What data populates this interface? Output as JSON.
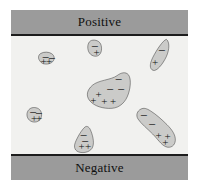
{
  "figure": {
    "name": "dielectric-polarization-diagram",
    "background_color": "#f1f1ef",
    "electrode_color": "#9b9b9b",
    "blob_fill_color": "#cbcbc9",
    "blob_stroke_color": "#1d1d1d"
  },
  "electrodes": {
    "top_label": "Positive",
    "bottom_label": "Negative"
  },
  "symbols": {
    "plus": "+",
    "minus": "−"
  },
  "domains": [
    {
      "name": "domain-upper-left",
      "shape": "rounded-blob",
      "path": "M 86 152 C 80 144 82 134 90 130 C 99 125 113 125 122 131 C 131 137 132 148 125 155 C 117 163 103 164 94 160 C 90 158 88 155 86 152 Z",
      "charges": [
        {
          "sign": "minus",
          "x": 103,
          "y": 141
        },
        {
          "sign": "minus",
          "x": 122,
          "y": 144
        },
        {
          "sign": "plus",
          "x": 98,
          "y": 152
        },
        {
          "sign": "plus",
          "x": 114,
          "y": 153
        }
      ]
    },
    {
      "name": "domain-top-center",
      "shape": "oval-blob",
      "path": "M 238 93 C 230 99 228 113 233 125 C 239 138 254 142 263 136 C 272 130 274 114 269 102 C 264 91 247 87 238 93 Z",
      "charges": [
        {
          "sign": "minus",
          "x": 251,
          "y": 108
        },
        {
          "sign": "plus",
          "x": 257,
          "y": 126
        }
      ]
    },
    {
      "name": "domain-upper-right",
      "shape": "tilted-ellipse-blob",
      "path": "M 466 88 C 456 91 437 119 425 143 C 415 163 416 177 426 181 C 437 185 455 163 466 140 C 476 118 476 95 466 88 Z",
      "charges": [
        {
          "sign": "minus",
          "x": 452,
          "y": 119
        },
        {
          "sign": "plus",
          "x": 432,
          "y": 155
        }
      ]
    },
    {
      "name": "domain-center-large",
      "shape": "teardrop-blob",
      "path": "M 318 197 C 331 187 344 185 352 194 C 360 204 360 228 352 252 C 344 276 327 293 303 295 C 276 297 249 288 236 272 C 224 257 228 240 244 226 C 262 210 300 210 318 197 Z",
      "charges": [
        {
          "sign": "minus",
          "x": 322,
          "y": 208
        },
        {
          "sign": "minus",
          "x": 297,
          "y": 238
        },
        {
          "sign": "minus",
          "x": 330,
          "y": 237
        },
        {
          "sign": "plus",
          "x": 263,
          "y": 252
        },
        {
          "sign": "plus",
          "x": 247,
          "y": 271
        },
        {
          "sign": "plus",
          "x": 280,
          "y": 273
        },
        {
          "sign": "plus",
          "x": 306,
          "y": 272
        }
      ]
    },
    {
      "name": "domain-mid-left",
      "shape": "circle-blob",
      "path": "M 57 296 C 47 303 45 317 52 327 C 60 338 76 339 85 331 C 94 323 94 307 86 299 C 78 291 64 291 57 296 Z",
      "charges": [
        {
          "sign": "minus",
          "x": 66,
          "y": 307
        },
        {
          "sign": "minus",
          "x": 83,
          "y": 308
        },
        {
          "sign": "plus",
          "x": 69,
          "y": 323
        },
        {
          "sign": "plus",
          "x": 84,
          "y": 324
        }
      ]
    },
    {
      "name": "domain-lower-right",
      "shape": "elongated-diagonal-blob",
      "path": "M 390 297 C 378 303 374 316 381 327 C 390 341 410 357 425 372 C 440 387 450 404 464 410 C 479 416 492 407 493 391 C 494 374 482 358 468 344 C 452 328 435 313 419 303 C 407 295 398 293 390 297 Z",
      "charges": [
        {
          "sign": "minus",
          "x": 398,
          "y": 314
        },
        {
          "sign": "minus",
          "x": 423,
          "y": 341
        },
        {
          "sign": "plus",
          "x": 443,
          "y": 374
        },
        {
          "sign": "plus",
          "x": 470,
          "y": 378
        },
        {
          "sign": "plus",
          "x": 463,
          "y": 396
        }
      ]
    },
    {
      "name": "domain-bottom-center",
      "shape": "egg-blob",
      "path": "M 222 351 C 212 359 199 382 193 397 C 187 412 192 424 207 427 C 223 430 240 424 245 411 C 251 396 244 372 238 359 C 234 350 227 347 222 351 Z",
      "charges": [
        {
          "sign": "minus",
          "x": 217,
          "y": 375
        },
        {
          "sign": "minus",
          "x": 222,
          "y": 392
        },
        {
          "sign": "plus",
          "x": 212,
          "y": 408
        },
        {
          "sign": "plus",
          "x": 231,
          "y": 409
        }
      ]
    }
  ]
}
